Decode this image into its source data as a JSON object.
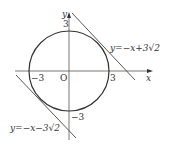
{
  "diagram": {
    "axes": {
      "x_label": "x",
      "y_label": "y",
      "origin_label": "O"
    },
    "ticks": {
      "x_pos": "3",
      "x_neg": "−3",
      "y_pos": "3",
      "y_neg": "−3"
    },
    "circle": {
      "equation": "x² + y² = 9",
      "radius": 3
    },
    "tangents": [
      {
        "label": "y=−x+3√2"
      },
      {
        "label": "y=−x−3√2"
      }
    ]
  }
}
